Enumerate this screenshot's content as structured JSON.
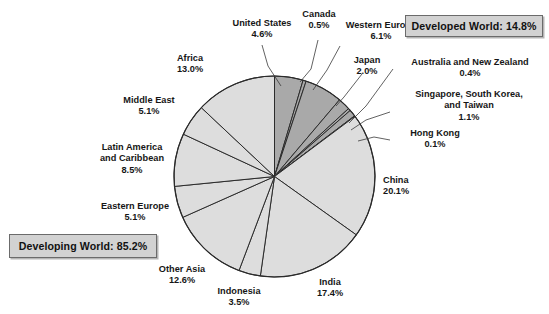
{
  "chart_data": {
    "type": "pie",
    "title": "",
    "units": "percent",
    "total": 100.0,
    "legend_position": "inside-callouts",
    "grid": false,
    "categories": [
      "United States",
      "Canada",
      "Western Europe",
      "Japan",
      "Australia and New Zealand",
      "Singapore, South Korea, and Taiwan",
      "Hong Kong",
      "China",
      "India",
      "Indonesia",
      "Other Asia",
      "Eastern Europe",
      "Latin America and Caribbean",
      "Middle East",
      "Africa"
    ],
    "values": [
      4.6,
      0.5,
      6.1,
      2.0,
      0.4,
      1.1,
      0.1,
      20.1,
      17.4,
      3.5,
      12.6,
      5.1,
      8.5,
      5.1,
      13.0
    ],
    "groups": [
      {
        "name": "Developed World",
        "total": 14.8,
        "members": [
          "United States",
          "Canada",
          "Western Europe",
          "Japan",
          "Australia and New Zealand",
          "Singapore, South Korea, and Taiwan",
          "Hong Kong"
        ],
        "color": "#a9a9a9"
      },
      {
        "name": "Developing World",
        "total": 85.2,
        "members": [
          "China",
          "India",
          "Indonesia",
          "Other Asia",
          "Eastern Europe",
          "Latin America and Caribbean",
          "Middle East",
          "Africa"
        ],
        "color": "#dddddd"
      }
    ]
  },
  "header": {
    "cropped_text": ""
  },
  "callouts": {
    "developed": "Developed World: 14.8%",
    "developing": "Developing World: 85.2%"
  },
  "labels": {
    "united_states": {
      "name": "United States",
      "pct": "4.6%"
    },
    "canada": {
      "name": "Canada",
      "pct": "0.5%"
    },
    "western_europe": {
      "name": "Western Europe",
      "pct": "6.1%"
    },
    "japan": {
      "name": "Japan",
      "pct": "2.0%"
    },
    "australia_nz": {
      "name": "Australia and New Zealand",
      "pct": "0.4%"
    },
    "singapore": {
      "name_line1": "Singapore, South Korea,",
      "name_line2": "and Taiwan",
      "pct": "1.1%"
    },
    "hong_kong": {
      "name": "Hong Kong",
      "pct": "0.1%"
    },
    "china": {
      "name": "China",
      "pct": "20.1%"
    },
    "india": {
      "name": "India",
      "pct": "17.4%"
    },
    "indonesia": {
      "name": "Indonesia",
      "pct": "3.5%"
    },
    "other_asia": {
      "name": "Other Asia",
      "pct": "12.6%"
    },
    "eastern_europe": {
      "name": "Eastern Europe",
      "pct": "5.1%"
    },
    "latin_america": {
      "name_line1": "Latin America",
      "name_line2": "and Caribbean",
      "pct": "8.5%"
    },
    "middle_east": {
      "name": "Middle East",
      "pct": "5.1%"
    },
    "africa": {
      "name": "Africa",
      "pct": "13.0%"
    }
  },
  "style": {
    "developed_color": "#a9a9a9",
    "developing_color": "#dddddd",
    "slice_stroke": "#2b2b2b",
    "callout_fill": "#d2d2d2",
    "callout_border": "#6b6b6b",
    "background": "#ffffff"
  }
}
